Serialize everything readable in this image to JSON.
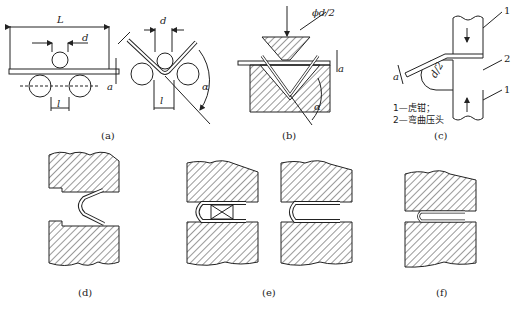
{
  "figure": {
    "panels": [
      {
        "id": "a",
        "caption": "(a)",
        "dims": {
          "L": "L",
          "d": "d",
          "a": "a",
          "l": "l",
          "alpha": "α"
        }
      },
      {
        "id": "b",
        "caption": "(b)",
        "dims": {
          "diameter": "ϕd/2",
          "a": "a",
          "alpha": "α"
        }
      },
      {
        "id": "c",
        "caption": "(c)",
        "dims": {
          "radius": "d/2",
          "a": "a"
        },
        "callouts": [
          "1",
          "2",
          "1"
        ],
        "legend": [
          "1—虎钳；",
          "2—弯曲压头"
        ]
      },
      {
        "id": "d",
        "caption": "(d)"
      },
      {
        "id": "e",
        "caption": "(e)"
      },
      {
        "id": "f",
        "caption": "(f)"
      }
    ]
  },
  "colors": {
    "line": "#222222",
    "hatch": "#333333",
    "bg": "#ffffff"
  }
}
